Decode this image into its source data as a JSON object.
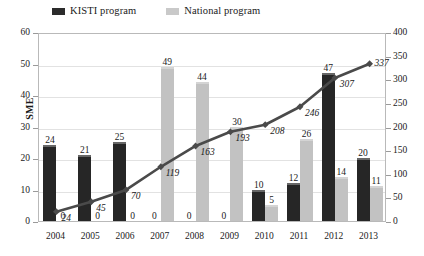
{
  "legend": {
    "items": [
      {
        "label": "KISTI program",
        "color": "#2b2b2b",
        "icon": "square-swatch-dark"
      },
      {
        "label": "National program",
        "color": "#c9c9c9",
        "icon": "square-swatch-light"
      }
    ]
  },
  "axes": {
    "y_left_title": "SME",
    "y_left_ticks": [
      "0",
      "10",
      "20",
      "30",
      "40",
      "50",
      "60"
    ],
    "y_right_ticks": [
      "0",
      "50",
      "100",
      "150",
      "200",
      "250",
      "300",
      "350",
      "400"
    ],
    "x_ticks": [
      "2004",
      "2005",
      "2006",
      "2007",
      "2008",
      "2009",
      "2010",
      "2011",
      "2012",
      "2013"
    ]
  },
  "chart_data": {
    "type": "bar",
    "title": "",
    "subtitle": "",
    "xlabel": "",
    "ylabel": "SME",
    "y2label": "",
    "categories": [
      "2004",
      "2005",
      "2006",
      "2007",
      "2008",
      "2009",
      "2010",
      "2011",
      "2012",
      "2013"
    ],
    "series": [
      {
        "name": "KISTI program",
        "type": "bar",
        "axis": "left",
        "color": "#262626",
        "values": [
          24,
          21,
          25,
          0,
          0,
          0,
          10,
          12,
          47,
          20
        ],
        "labels": [
          "24",
          "21",
          "25",
          "0",
          "0",
          "0",
          "10",
          "12",
          "47",
          "20"
        ]
      },
      {
        "name": "National program",
        "type": "bar",
        "axis": "left",
        "color": "#c2c2c2",
        "values": [
          0,
          0,
          0,
          49,
          44,
          30,
          5,
          26,
          14,
          11
        ],
        "labels": [
          "0",
          "0",
          "0",
          "49",
          "44",
          "30",
          "5",
          "26",
          "14",
          "11"
        ]
      },
      {
        "name": "Cumulative",
        "type": "line",
        "axis": "right",
        "color": "#4a4a4a",
        "marker": "diamond",
        "values": [
          24,
          45,
          70,
          119,
          163,
          193,
          208,
          246,
          307,
          337
        ],
        "labels": [
          "24",
          "45",
          "70",
          "119",
          "163",
          "193",
          "208",
          "246",
          "307",
          "337"
        ]
      }
    ],
    "ylim": [
      0,
      60
    ],
    "y2lim": [
      0,
      400
    ],
    "ytick_step": 10,
    "y2tick_step": 50,
    "grid": true,
    "legend_position": "top"
  }
}
